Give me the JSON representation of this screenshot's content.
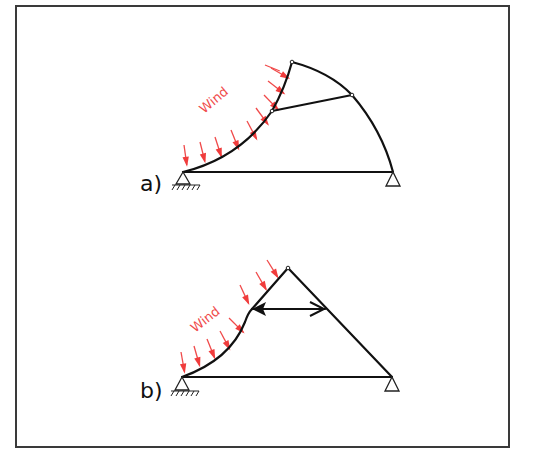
{
  "figure": {
    "border_color": "#3a3a3a",
    "wind_color": "#f04a4a",
    "member_color": "#111111"
  },
  "diagram_a": {
    "label": "a)",
    "wind_label": "Wind",
    "description": "Arch truss with curved windward chord, tie rod between windward mid node and leeward arc node, pinned left support, roller right support",
    "nodes": {
      "left_support": [
        183,
        172
      ],
      "windward_mid": [
        272,
        111
      ],
      "crown": [
        292,
        62
      ],
      "leeward_mid": [
        352,
        95
      ],
      "right_support": [
        393,
        172
      ]
    },
    "wind_arrow_count": 10
  },
  "diagram_b": {
    "label": "b)",
    "wind_label": "Wind",
    "description": "Triangular frame with curved windward lower chord, horizontal strut with arrowheads at both ends, pinned left support, roller right support",
    "nodes": {
      "left_support": [
        182,
        377
      ],
      "windward_mid": [
        251,
        309
      ],
      "apex": [
        288,
        268
      ],
      "leeward_mid": [
        325,
        309
      ],
      "right_support": [
        392,
        377
      ]
    },
    "wind_arrow_count": 9
  }
}
